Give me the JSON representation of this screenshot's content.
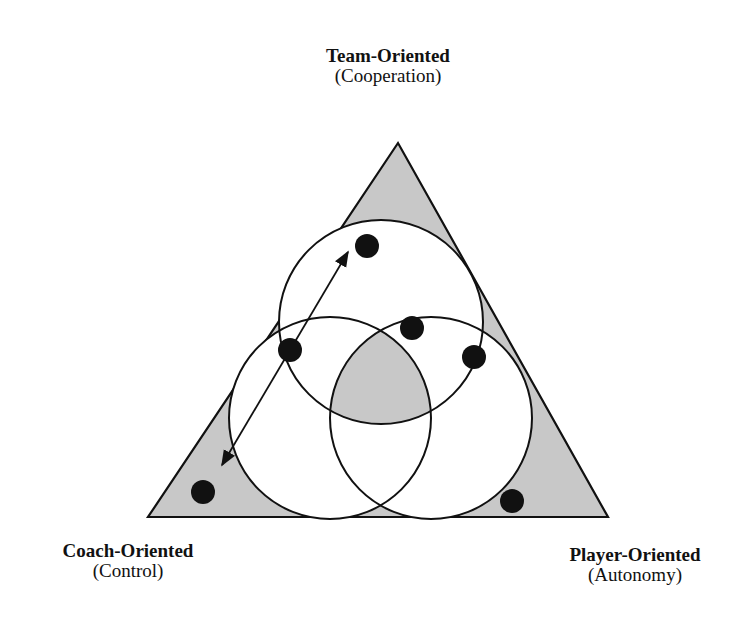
{
  "diagram": {
    "vertices": {
      "top": {
        "title": "Team-Oriented",
        "subtitle": "(Cooperation)"
      },
      "left": {
        "title": "Coach-Oriented",
        "subtitle": "(Control)"
      },
      "right": {
        "title": "Player-Oriented",
        "subtitle": "(Autonomy)"
      }
    },
    "shapes": {
      "triangle": {
        "points": "398,143 148,517 608,517",
        "fill": "#c8c8c8",
        "stroke": "#111111"
      },
      "circles": [
        {
          "name": "team-circle",
          "cx": 381,
          "cy": 322,
          "r": 102
        },
        {
          "name": "coach-circle",
          "cx": 330,
          "cy": 418,
          "r": 101
        },
        {
          "name": "player-circle",
          "cx": 431,
          "cy": 418,
          "r": 101
        }
      ],
      "dots": [
        {
          "cx": 367,
          "cy": 246,
          "r": 12
        },
        {
          "cx": 290,
          "cy": 350,
          "r": 12
        },
        {
          "cx": 412,
          "cy": 328,
          "r": 12
        },
        {
          "cx": 474,
          "cy": 357,
          "r": 12
        },
        {
          "cx": 203,
          "cy": 492,
          "r": 12
        },
        {
          "cx": 512,
          "cy": 501,
          "r": 12
        }
      ],
      "arrow": {
        "x1": 348,
        "y1": 252,
        "x2": 222,
        "y2": 465,
        "bidirectional": true
      }
    },
    "colors": {
      "shade": "#c8c8c8",
      "line": "#111111",
      "background": "#ffffff"
    }
  }
}
